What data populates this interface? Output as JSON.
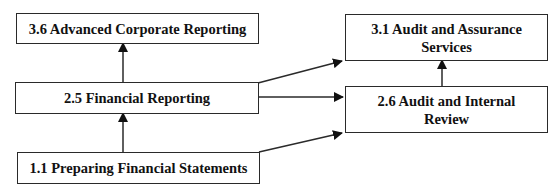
{
  "diagram": {
    "type": "flowchart",
    "nodes": [
      {
        "id": "n36",
        "label": "3.6 Advanced Corporate Reporting"
      },
      {
        "id": "n25",
        "label": "2.5 Financial Reporting"
      },
      {
        "id": "n11",
        "label": "1.1 Preparing Financial Statements"
      },
      {
        "id": "n31",
        "label": "3.1 Audit and Assurance Services"
      },
      {
        "id": "n26",
        "label": "2.6 Audit and Internal Review"
      }
    ],
    "edges": [
      {
        "from": "1.1 Preparing Financial Statements",
        "to": "2.5 Financial Reporting"
      },
      {
        "from": "2.5 Financial Reporting",
        "to": "3.6 Advanced Corporate Reporting"
      },
      {
        "from": "2.5 Financial Reporting",
        "to": "3.1 Audit and Assurance Services"
      },
      {
        "from": "2.5 Financial Reporting",
        "to": "2.6 Audit and Internal Review"
      },
      {
        "from": "1.1 Preparing Financial Statements",
        "to": "2.6 Audit and Internal Review"
      },
      {
        "from": "2.6 Audit and Internal Review",
        "to": "3.1 Audit and Assurance Services"
      }
    ],
    "colors": {
      "stroke": "#2a2a2a",
      "text": "#111111",
      "background": "#ffffff"
    }
  }
}
